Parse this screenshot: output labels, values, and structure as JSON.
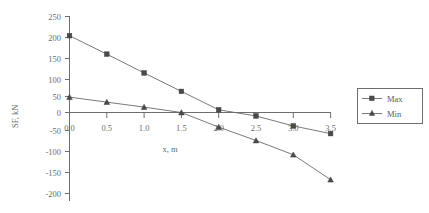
{
  "chart_data": {
    "type": "line",
    "title": "",
    "xlabel": "x, m",
    "ylabel": "SF, kN",
    "x": [
      0.0,
      0.5,
      1.0,
      1.5,
      2.0,
      2.5,
      3.0,
      3.5
    ],
    "xlim": [
      0.0,
      3.5
    ],
    "ylim": [
      -200,
      250
    ],
    "xticks": [
      "0.0",
      "0.5",
      "1.0",
      "1.5",
      "2.0",
      "2.5",
      "3.0",
      "3.5"
    ],
    "yticks": [
      "250",
      "200",
      "150",
      "100",
      "50",
      "0",
      "-50",
      "-100",
      "-150",
      "-200"
    ],
    "grid": false,
    "legend_position": "right",
    "series": [
      {
        "name": "Max",
        "marker": "square",
        "values": [
          200,
          152,
          103,
          55,
          7,
          -9,
          -35,
          -55
        ]
      },
      {
        "name": "Min",
        "marker": "triangle",
        "values": [
          40,
          27,
          14,
          0,
          -38,
          -73,
          -110,
          -175
        ]
      }
    ]
  },
  "legend": {
    "entries": [
      {
        "label": "Max"
      },
      {
        "label": "Min"
      }
    ]
  },
  "axes": {
    "y_axis_title": "SF, kN",
    "x_axis_title": "x, m"
  }
}
